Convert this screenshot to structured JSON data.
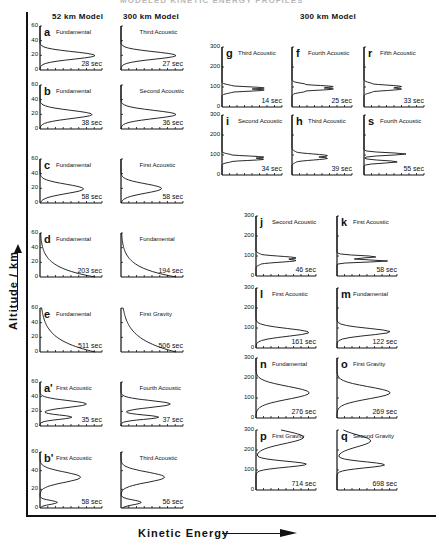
{
  "figure": {
    "top_cut_title": "MODELED KINETIC ENERGY PROFILES",
    "left_column_header_1": "52 km  Model",
    "left_column_header_2": "300 km  Model",
    "right_column_header": "300 km  Model",
    "y_axis_label": "Altitude / km",
    "x_axis_label": "Kinetic  Energy"
  },
  "chart_data": [
    {
      "type": "line",
      "id": "a-52",
      "model": "52 km",
      "label": "a",
      "mode": "Fundamental",
      "period": "28 sec",
      "ylim": [
        0,
        60
      ],
      "yticks": [
        "0",
        "20",
        "40",
        "60"
      ],
      "profile": "single peak ~20 km"
    },
    {
      "type": "line",
      "id": "a-300",
      "model": "300 km",
      "label": "",
      "mode": "Third Acoustic",
      "period": "27 sec",
      "ylim": [
        0,
        60
      ],
      "profile": "single peak ~20 km"
    },
    {
      "type": "line",
      "id": "b-52",
      "model": "52 km",
      "label": "b",
      "mode": "Fundamental",
      "period": "38 sec",
      "ylim": [
        0,
        60
      ],
      "yticks": [
        "0",
        "20",
        "40",
        "60"
      ],
      "profile": "single peak ~20 km"
    },
    {
      "type": "line",
      "id": "b-300",
      "model": "300 km",
      "label": "",
      "mode": "Second Acoustic",
      "period": "36 sec",
      "ylim": [
        0,
        60
      ],
      "profile": "single peak ~20 km"
    },
    {
      "type": "line",
      "id": "c-52",
      "model": "52 km",
      "label": "c",
      "mode": "Fundamental",
      "period": "58 sec",
      "ylim": [
        0,
        60
      ],
      "yticks": [
        "0",
        "20",
        "40",
        "60"
      ],
      "profile": "single peak ~20 km"
    },
    {
      "type": "line",
      "id": "c-300",
      "model": "300 km",
      "label": "",
      "mode": "First Acoustic",
      "period": "58 sec",
      "ylim": [
        0,
        60
      ],
      "profile": "single peak ~20 km"
    },
    {
      "type": "line",
      "id": "d-52",
      "model": "52 km",
      "label": "d",
      "mode": "Fundamental",
      "period": "203 sec",
      "ylim": [
        0,
        60
      ],
      "yticks": [
        "0",
        "20",
        "40",
        "60"
      ],
      "profile": "decaying with altitude"
    },
    {
      "type": "line",
      "id": "d-300",
      "model": "300 km",
      "label": "",
      "mode": "Fundamental",
      "period": "194 sec",
      "ylim": [
        0,
        60
      ],
      "profile": "decaying with altitude"
    },
    {
      "type": "line",
      "id": "e-52",
      "model": "52 km",
      "label": "e",
      "mode": "Fundamental",
      "period": "511 sec",
      "ylim": [
        0,
        60
      ],
      "yticks": [
        "0",
        "20",
        "40",
        "60"
      ],
      "profile": "decaying with altitude"
    },
    {
      "type": "line",
      "id": "e-300",
      "model": "300 km",
      "label": "",
      "mode": "First Gravity",
      "period": "506 sec",
      "ylim": [
        0,
        60
      ],
      "profile": "decaying with altitude"
    },
    {
      "type": "line",
      "id": "a2-52",
      "model": "52 km",
      "label": "a'",
      "mode": "First Acoustic",
      "period": "35 sec",
      "ylim": [
        0,
        60
      ],
      "yticks": [
        "0",
        "20",
        "40",
        "60"
      ],
      "profile": "double peak ~10 and ~30 km"
    },
    {
      "type": "line",
      "id": "a2-300",
      "model": "300 km",
      "label": "",
      "mode": "Fourth Acoustic",
      "period": "37 sec",
      "ylim": [
        0,
        60
      ],
      "profile": "double peak ~10 and ~30 km"
    },
    {
      "type": "line",
      "id": "b2-52",
      "model": "52 km",
      "label": "b'",
      "mode": "First Acoustic",
      "period": "58 sec",
      "ylim": [
        0,
        60
      ],
      "yticks": [
        "0",
        "20",
        "40",
        "60"
      ],
      "profile": "peak ~33 km"
    },
    {
      "type": "line",
      "id": "b2-300",
      "model": "300 km",
      "label": "",
      "mode": "Third Acoustic",
      "period": "56 sec",
      "ylim": [
        0,
        60
      ],
      "profile": "peak ~33 km"
    },
    {
      "type": "line",
      "id": "g",
      "model": "300 km",
      "label": "g",
      "mode": "Third Acoustic",
      "period": "14 sec",
      "ylim": [
        0,
        300
      ],
      "yticks": [
        "0",
        "100",
        "200",
        "300"
      ],
      "profile": "oscillatory near 80-100 km"
    },
    {
      "type": "line",
      "id": "f",
      "model": "300 km",
      "label": "f",
      "mode": "Fourth Acoustic",
      "period": "25 sec",
      "ylim": [
        0,
        300
      ],
      "profile": "oscillatory near 80-110 km"
    },
    {
      "type": "line",
      "id": "r",
      "model": "300 km",
      "label": "r",
      "mode": "Fifth Acoustic",
      "period": "33 sec",
      "ylim": [
        0,
        300
      ],
      "profile": "oscillatory near 80-110 km"
    },
    {
      "type": "line",
      "id": "i",
      "model": "300 km",
      "label": "i",
      "mode": "Second Acoustic",
      "period": "34 sec",
      "ylim": [
        0,
        300
      ],
      "yticks": [
        "0",
        "100",
        "200",
        "300"
      ],
      "profile": "oscillatory near 80-100 km"
    },
    {
      "type": "line",
      "id": "h",
      "model": "300 km",
      "label": "h",
      "mode": "Third Acoustic",
      "period": "39 sec",
      "ylim": [
        0,
        300
      ],
      "profile": "double peak near 80-110 km"
    },
    {
      "type": "line",
      "id": "s",
      "model": "300 km",
      "label": "s",
      "mode": "Fourth Acoustic",
      "period": "55 sec",
      "ylim": [
        0,
        300
      ],
      "profile": "peaks near 80-110 km"
    },
    {
      "type": "line",
      "id": "j",
      "model": "300 km",
      "label": "j",
      "mode": "Second Acoustic",
      "period": "46 sec",
      "ylim": [
        0,
        300
      ],
      "yticks": [
        "0",
        "100",
        "200",
        "300"
      ],
      "profile": "double peak near 75-95 km"
    },
    {
      "type": "line",
      "id": "k",
      "model": "300 km",
      "label": "k",
      "mode": "First Acoustic",
      "period": "58 sec",
      "ylim": [
        0,
        300
      ],
      "profile": "double peak near 75-95 km"
    },
    {
      "type": "line",
      "id": "l",
      "model": "300 km",
      "label": "l",
      "mode": "First Acoustic",
      "period": "161 sec",
      "ylim": [
        0,
        300
      ],
      "yticks": [
        "0",
        "100",
        "200",
        "300"
      ],
      "profile": "single peak ~80 km"
    },
    {
      "type": "line",
      "id": "m",
      "model": "300 km",
      "label": "m",
      "mode": "Fundamental",
      "period": "122 sec",
      "ylim": [
        0,
        300
      ],
      "profile": "single peak ~80 km"
    },
    {
      "type": "line",
      "id": "n",
      "model": "300 km",
      "label": "n",
      "mode": "Fundamental",
      "period": "276 sec",
      "ylim": [
        0,
        300
      ],
      "yticks": [
        "0",
        "100",
        "200",
        "300"
      ],
      "profile": "single peak ~120 km"
    },
    {
      "type": "line",
      "id": "o",
      "model": "300 km",
      "label": "o",
      "mode": "First Gravity",
      "period": "269 sec",
      "ylim": [
        0,
        300
      ],
      "profile": "single peak ~120 km"
    },
    {
      "type": "line",
      "id": "p",
      "model": "300 km",
      "label": "p",
      "mode": "First Gravity",
      "period": "714 sec",
      "ylim": [
        0,
        300
      ],
      "yticks": [
        "0",
        "100",
        "200",
        "300"
      ],
      "profile": "peaks ~130 and ~260 km"
    },
    {
      "type": "line",
      "id": "q",
      "model": "300 km",
      "label": "q",
      "mode": "Second Gravity",
      "period": "698 sec",
      "ylim": [
        0,
        300
      ],
      "profile": "peaks ~130 and ~240 km"
    }
  ]
}
